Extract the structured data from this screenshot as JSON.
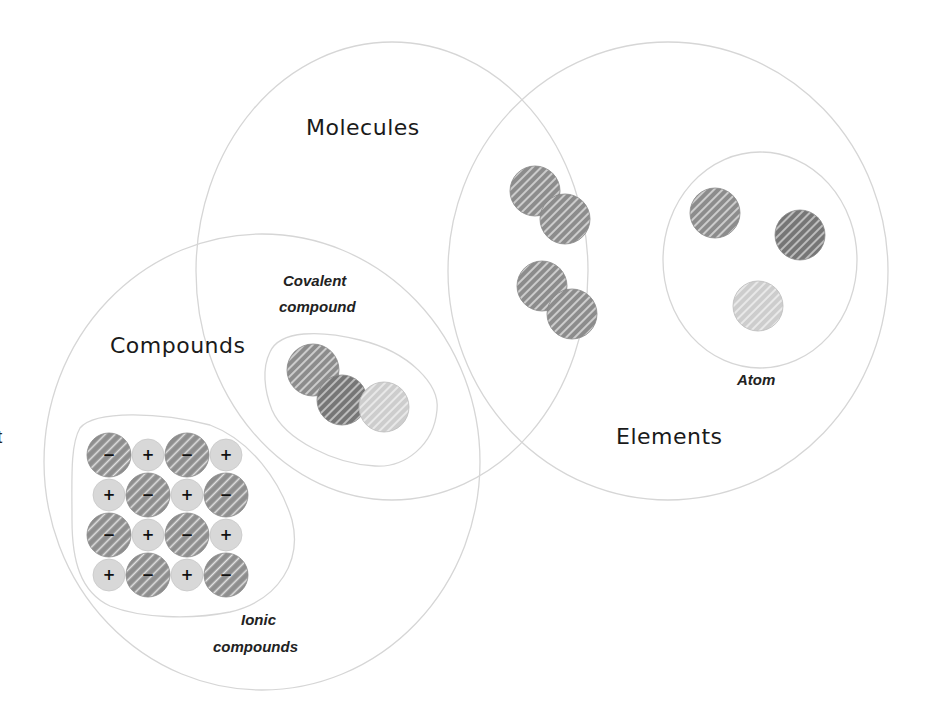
{
  "diagram": {
    "type": "venn",
    "sets": [
      {
        "id": "molecules",
        "label": "Molecules"
      },
      {
        "id": "elements",
        "label": "Elements"
      },
      {
        "id": "compounds",
        "label": "Compounds"
      }
    ],
    "subgroups": [
      {
        "id": "covalent",
        "label_line1": "Covalent",
        "label_line2": "compound",
        "in_sets": [
          "molecules",
          "compounds"
        ]
      },
      {
        "id": "ionic",
        "label_line1": "Ionic",
        "label_line2": "compounds",
        "in_sets": [
          "compounds"
        ]
      },
      {
        "id": "atom",
        "label": "Atom",
        "in_sets": [
          "elements"
        ]
      }
    ],
    "diatomic_molecules_label": "",
    "ion_symbols": {
      "anion": "−",
      "cation": "+"
    },
    "ionic_lattice": [
      [
        "−",
        "+",
        "−",
        "+"
      ],
      [
        "+",
        "−",
        "+",
        "−"
      ],
      [
        "−",
        "+",
        "−",
        "+"
      ],
      [
        "+",
        "−",
        "+",
        "−"
      ]
    ],
    "edge_fragment": "t",
    "colors": {
      "outline": "#d4d4d4",
      "atom_dark": "#8c8c8c",
      "atom_darker": "#7a7a7a",
      "atom_light": "#cfcfcf",
      "hatch": "#ffffff",
      "text": "#1a1a1a"
    }
  }
}
